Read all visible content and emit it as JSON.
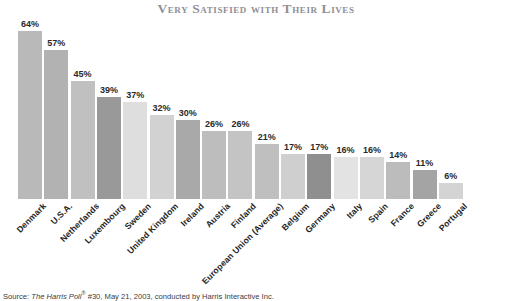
{
  "chart": {
    "title": "Very Satisfied with Their Lives",
    "source_prefix": "Source: ",
    "source_italic": "The Harris Poll",
    "source_reg": "®",
    "source_suffix": " #30, May 21, 2003, conducted by Harris Interactive Inc."
  },
  "chart_data": {
    "type": "bar",
    "title": "Very Satisfied with Their Lives",
    "xlabel": "",
    "ylabel": "",
    "ylim": [
      0,
      70
    ],
    "grid": false,
    "legend": null,
    "value_suffix": "%",
    "categories": [
      "Denmark",
      "U.S.A.",
      "Netherlands",
      "Luxembourg",
      "Sweden",
      "United Kingdom",
      "Ireland",
      "Austria",
      "Finland",
      "European Union (Average)",
      "Belgium",
      "Germany",
      "Italy",
      "Spain",
      "France",
      "Greece",
      "Portugal"
    ],
    "values": [
      64,
      57,
      45,
      39,
      37,
      32,
      30,
      26,
      26,
      21,
      17,
      17,
      16,
      16,
      14,
      11,
      6
    ],
    "value_labels": [
      "64%",
      "57%",
      "45%",
      "39%",
      "37%",
      "32%",
      "30%",
      "26%",
      "26%",
      "21%",
      "17%",
      "17%",
      "16%",
      "16%",
      "14%",
      "11%",
      "6%"
    ],
    "bar_colors": [
      "#b9b9b9",
      "#b2b2b2",
      "#c0c0c0",
      "#999999",
      "#dedede",
      "#d2d2d2",
      "#a9a9a9",
      "#bdbdbd",
      "#c4c4c4",
      "#bfbfbf",
      "#cfcfcf",
      "#8f8f8f",
      "#e3e3e3",
      "#d6d6d6",
      "#bcbcbc",
      "#a4a4a4",
      "#d4d4d4"
    ]
  }
}
